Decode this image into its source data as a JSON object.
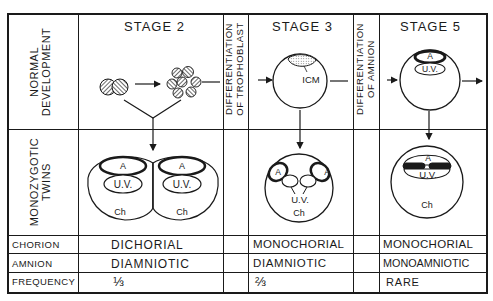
{
  "row_headers": {
    "normal_development": [
      "NORMAL",
      "DEVELOPMENT"
    ],
    "monozygotic_twins": [
      "MONOZYGOTIC",
      "TWINS"
    ],
    "chorion": "CHORION",
    "amnion": "AMNION",
    "frequency": "FREQUENCY"
  },
  "transitions": {
    "trophoblast": [
      "DIFFERENTIATION",
      "OF TROPHOBLAST"
    ],
    "amnion": [
      "DIFFERENTIATION",
      "OF AMNION"
    ]
  },
  "stages": [
    {
      "title": "STAGE 2",
      "twin_labels": {
        "amnion": "A",
        "umbilical_vesicle": "U.V.",
        "chorion": "Ch"
      },
      "chorion": "DICHORIAL",
      "amnion": "DIAMNIOTIC",
      "frequency": "⅓"
    },
    {
      "title": "STAGE 3",
      "normal_label": "ICM",
      "twin_labels": {
        "amnion": "A",
        "umbilical_vesicle": "U.V.",
        "chorion": "Ch"
      },
      "chorion": "MONOCHORIAL",
      "amnion": "DIAMNIOTIC",
      "frequency": "⅔"
    },
    {
      "title": "STAGE 5",
      "normal_labels": {
        "amnion": "A",
        "umbilical_vesicle": "U.V."
      },
      "twin_labels": {
        "amnion": "A",
        "umbilical_vesicle": "U.V.",
        "chorion": "Ch"
      },
      "chorion": "MONOCHORIAL",
      "amnion": "MONOAMNIOTIC",
      "frequency": "RARE"
    }
  ]
}
